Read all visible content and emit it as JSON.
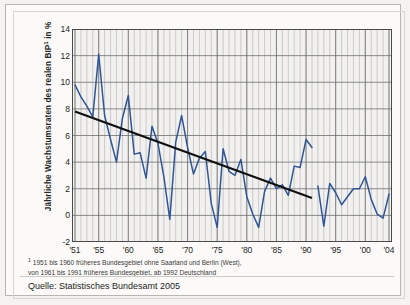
{
  "figure": {
    "y_axis_title_main": "Jährliche Wachstumsraten des realen BIP",
    "y_axis_title_sup": "1",
    "y_axis_title_tail": " in %",
    "footnote_marker": "1",
    "footnote_line1": " 1951 bis 1960 früheres Bundesgebiet ohne Saarland und Berlin (West),",
    "footnote_line2": "von 1961 bis 1991 früheres Bundesgebiet, ab 1992 Deutschland",
    "source": "Quelle: Statistisches Bundesamt 2005",
    "colors": {
      "series_blue": "#2f5596",
      "trend_black": "#101010",
      "gridline_major": "#6f6f6f",
      "gridline_minor": "#b9b9b9",
      "plot_background": "#f2f1ef",
      "frame": "#b9b6b1"
    }
  },
  "chart_data": {
    "type": "line",
    "title": "",
    "xlabel": "",
    "ylabel": "Jährliche Wachstumsraten des realen BIP in %",
    "ylim": [
      -2,
      14
    ],
    "xlim": [
      1951,
      2004
    ],
    "ytick_labels": [
      "14",
      "12",
      "10",
      "8",
      "6",
      "4",
      "2",
      "0",
      "-2"
    ],
    "ytick_values": [
      14,
      12,
      10,
      8,
      6,
      4,
      2,
      0,
      -2
    ],
    "xtick_labels": [
      "'51",
      "'55",
      "'60",
      "'65",
      "'70",
      "'75",
      "'80",
      "'85",
      "'90",
      "'95",
      "'00",
      "'04"
    ],
    "xtick_values": [
      1951,
      1955,
      1960,
      1965,
      1970,
      1975,
      1980,
      1985,
      1990,
      1995,
      2000,
      2004
    ],
    "grid": true,
    "grid_minor_x": true,
    "legend": false,
    "series": [
      {
        "name": "Jährliche Wachstumsrate des realen BIP",
        "color": "#2f5596",
        "x": [
          1951,
          1952,
          1953,
          1954,
          1955,
          1956,
          1957,
          1958,
          1959,
          1960,
          1961,
          1962,
          1963,
          1964,
          1965,
          1966,
          1967,
          1968,
          1969,
          1970,
          1971,
          1972,
          1973,
          1974,
          1975,
          1976,
          1977,
          1978,
          1979,
          1980,
          1981,
          1982,
          1983,
          1984,
          1985,
          1986,
          1987,
          1988,
          1989,
          1990,
          1991
        ],
        "values": [
          9.8,
          8.9,
          8.2,
          7.4,
          12.1,
          7.5,
          5.7,
          4.0,
          7.3,
          9.0,
          4.6,
          4.7,
          2.8,
          6.7,
          5.4,
          2.9,
          -0.3,
          5.5,
          7.5,
          5.1,
          3.1,
          4.3,
          4.8,
          0.9,
          -0.9,
          5.0,
          3.3,
          3.0,
          4.2,
          1.4,
          0.1,
          -0.9,
          1.8,
          2.8,
          2.0,
          2.3,
          1.5,
          3.7,
          3.6,
          5.7,
          5.1
        ]
      },
      {
        "name": "Jährliche Wachstumsrate des realen BIP (Deutschland)",
        "color": "#2f5596",
        "x": [
          1992,
          1993,
          1994,
          1995,
          1996,
          1997,
          1998,
          1999,
          2000,
          2001,
          2002,
          2003,
          2004
        ],
        "values": [
          2.2,
          -0.8,
          2.4,
          1.7,
          0.8,
          1.4,
          2.0,
          2.0,
          2.9,
          1.2,
          0.1,
          -0.2,
          1.6
        ]
      }
    ],
    "trendline": {
      "name": "Trendlinie",
      "color": "#101010",
      "x": [
        1951,
        1991
      ],
      "values": [
        7.8,
        1.3
      ]
    },
    "annotations": []
  }
}
